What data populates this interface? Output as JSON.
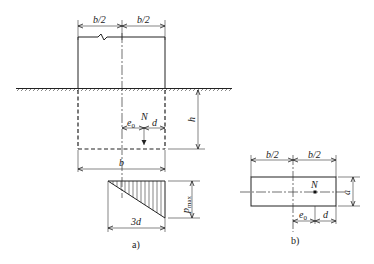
{
  "figure": {
    "panel_a": {
      "caption": "a)",
      "labels": {
        "half_width_left": "b/2",
        "half_width_right": "b/2",
        "depth": "h",
        "load": "N",
        "eccentricity": "e0",
        "e_sub": "0",
        "e_main": "e",
        "offset": "d",
        "width": "b",
        "pressure_base": "3d",
        "pressure_max": "p",
        "pressure_max_sub": "max"
      }
    },
    "panel_b": {
      "caption": "b)",
      "labels": {
        "half_width_left": "b/2",
        "half_width_right": "b/2",
        "load": "N",
        "side": "a",
        "e_main": "e",
        "e_sub": "0",
        "offset": "d"
      }
    }
  },
  "colors": {
    "line": "#222222",
    "background": "#ffffff"
  }
}
